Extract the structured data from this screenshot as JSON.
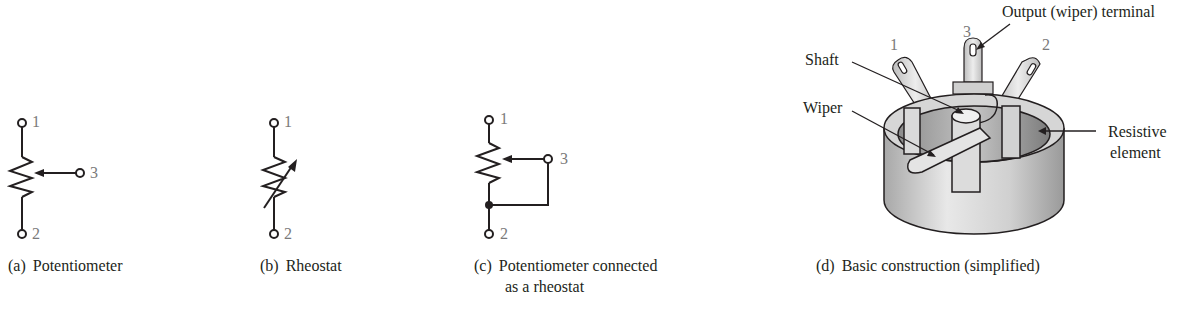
{
  "figure": {
    "panels": [
      {
        "id": "a",
        "tag": "(a)",
        "caption": "Potentiometer",
        "terminals": [
          "1",
          "3",
          "2"
        ]
      },
      {
        "id": "b",
        "tag": "(b)",
        "caption": "Rheostat",
        "terminals": [
          "1",
          "2"
        ]
      },
      {
        "id": "c",
        "tag": "(c)",
        "caption_line1": "Potentiometer connected",
        "caption_line2": "as a rheostat",
        "terminals": [
          "1",
          "3",
          "2"
        ]
      },
      {
        "id": "d",
        "tag": "(d)",
        "caption": "Basic construction (simplified)",
        "terminals": [
          "1",
          "3",
          "2"
        ],
        "callouts": {
          "output": "Output (wiper) terminal",
          "shaft": "Shaft",
          "wiper": "Wiper",
          "resistive_line1": "Resistive",
          "resistive_line2": "element"
        }
      }
    ],
    "colors": {
      "line": "#231f20",
      "terminal_label": "#7a7a7a",
      "body_light": "#e6e6e6",
      "body_mid": "#c8c8c8",
      "body_dark": "#9a9a9a"
    }
  }
}
